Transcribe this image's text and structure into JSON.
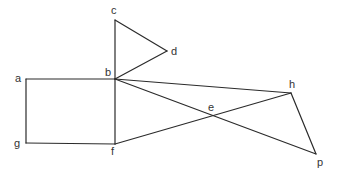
{
  "diagram": {
    "stroke_color": "#2b2b2b",
    "label_color": "#333333",
    "points": {
      "a": {
        "x": 26,
        "y": 79,
        "label": "a",
        "lx": 15,
        "ly": 82
      },
      "b": {
        "x": 115,
        "y": 79,
        "label": "b",
        "lx": 105,
        "ly": 76
      },
      "c": {
        "x": 115,
        "y": 20,
        "label": "c",
        "lx": 111,
        "ly": 14
      },
      "d": {
        "x": 167,
        "y": 51,
        "label": "d",
        "lx": 171,
        "ly": 55
      },
      "e": {
        "x": 213,
        "y": 115,
        "label": "e",
        "lx": 208,
        "ly": 111
      },
      "f": {
        "x": 115,
        "y": 144,
        "label": "f",
        "lx": 111,
        "ly": 155
      },
      "g": {
        "x": 26,
        "y": 143,
        "label": "g",
        "lx": 14,
        "ly": 147
      },
      "h": {
        "x": 291,
        "y": 93,
        "label": "h",
        "lx": 289,
        "ly": 88
      },
      "p": {
        "x": 316,
        "y": 154,
        "label": "p",
        "lx": 317,
        "ly": 166
      }
    },
    "edges": [
      [
        "a",
        "b"
      ],
      [
        "a",
        "g"
      ],
      [
        "g",
        "f"
      ],
      [
        "b",
        "f"
      ],
      [
        "b",
        "c"
      ],
      [
        "c",
        "d"
      ],
      [
        "d",
        "b"
      ],
      [
        "b",
        "h"
      ],
      [
        "b",
        "p"
      ],
      [
        "f",
        "h"
      ],
      [
        "h",
        "p"
      ]
    ]
  }
}
